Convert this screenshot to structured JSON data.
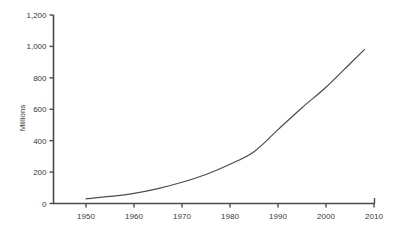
{
  "chart_data": {
    "type": "line",
    "title": "",
    "xlabel": "",
    "ylabel": "Millions",
    "xlim": [
      1945,
      2015
    ],
    "ylim": [
      0,
      1200
    ],
    "grid": false,
    "legend": "none",
    "x_ticks": [
      "1950",
      "1960",
      "1970",
      "1980",
      "1990",
      "2000",
      "2010"
    ],
    "y_ticks": [
      "0",
      "200",
      "400",
      "600",
      "800",
      "1,000",
      "1,200"
    ],
    "x_tick_values": [
      1950,
      1960,
      1970,
      1980,
      1990,
      2000,
      2010
    ],
    "y_tick_values": [
      0,
      200,
      400,
      600,
      800,
      1000,
      1200
    ],
    "series": [
      {
        "name": "Millions",
        "color": "#4d4d4d",
        "x": [
          1950,
          1955,
          1960,
          1965,
          1970,
          1975,
          1980,
          1985,
          1990,
          1995,
          2000,
          2005,
          2008
        ],
        "values": [
          30,
          45,
          65,
          95,
          135,
          185,
          250,
          330,
          470,
          610,
          740,
          890,
          980
        ]
      }
    ],
    "line_color": "#4d4d4d",
    "axis_color": "#4a4a4a"
  },
  "axes": {
    "y_axis_label": "Millions"
  }
}
